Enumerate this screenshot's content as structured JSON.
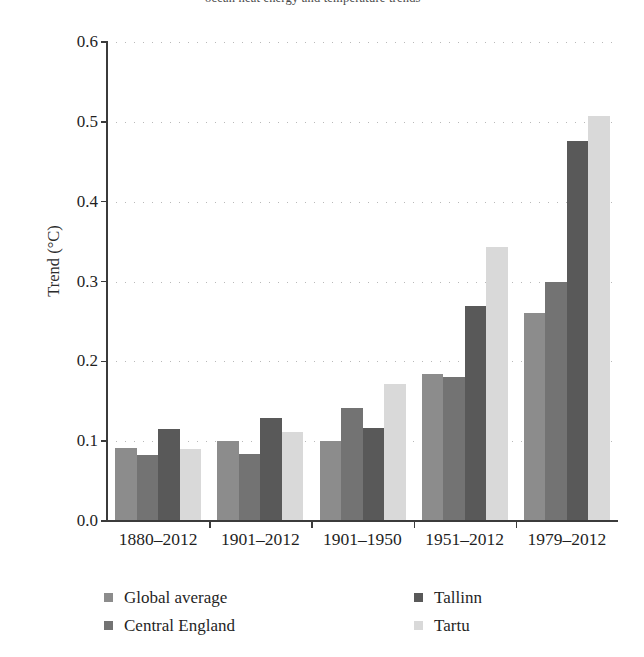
{
  "top_caption": {
    "text_fragment_partially_cropped": "ocean heat energy and temperature trends"
  },
  "chart_data": {
    "type": "bar",
    "title": "",
    "subtitle": "",
    "xlabel": "",
    "ylabel": "Trend (°C)",
    "categories": [
      "1880–2012",
      "1901–2012",
      "1901–1950",
      "1951–2012",
      "1979–2012"
    ],
    "series": [
      {
        "name": "Global average",
        "color": "#8c8c8c",
        "values": [
          0.092,
          0.1,
          0.1,
          0.184,
          0.261
        ]
      },
      {
        "name": "Central England",
        "color": "#737373",
        "values": [
          0.083,
          0.084,
          0.141,
          0.18,
          0.299
        ]
      },
      {
        "name": "Tallinn",
        "color": "#595959",
        "values": [
          0.115,
          0.129,
          0.116,
          0.269,
          0.476
        ]
      },
      {
        "name": "Tartu",
        "color": "#d9d9d9",
        "values": [
          0.09,
          0.111,
          0.172,
          0.343,
          0.507
        ]
      }
    ],
    "ylim": [
      0.0,
      0.6
    ],
    "ytick_values": [
      0.0,
      0.1,
      0.2,
      0.3,
      0.4,
      0.5,
      0.6
    ],
    "ytick_labels": [
      "0.0",
      "0.1",
      "0.2",
      "0.3",
      "0.4",
      "0.5",
      "0.6"
    ],
    "grid": "horizontal-dotted",
    "legend_position": "bottom",
    "legend_columns": 2
  },
  "legend": {
    "items": [
      {
        "label": "Global average",
        "color": "#8c8c8c"
      },
      {
        "label": "Central England",
        "color": "#737373"
      },
      {
        "label": "Tallinn",
        "color": "#595959"
      },
      {
        "label": "Tartu",
        "color": "#d9d9d9"
      }
    ]
  },
  "style": {
    "axis_color": "#3b3b3b",
    "grid_color": "#b9b9b9",
    "text_color": "#1f1f1f",
    "background": "#ffffff"
  }
}
